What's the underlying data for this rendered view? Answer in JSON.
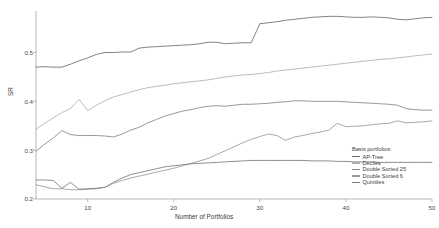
{
  "chart_data": {
    "type": "line",
    "title": "",
    "xlabel": "Number of Portfolios",
    "ylabel": "SR",
    "xlim": [
      4,
      50
    ],
    "ylim": [
      0.2,
      0.585
    ],
    "grid": false,
    "legend_position": "right-inside-bottom",
    "legend_title": "Basis portfolios:",
    "xticks": [
      10,
      20,
      30,
      40,
      50
    ],
    "xtick_labels": [
      "10",
      "20",
      "30",
      "40",
      "50"
    ],
    "yticks": [
      0.2,
      0.3,
      0.4,
      0.5
    ],
    "ytick_labels": [
      "0.2",
      "0.3",
      "0.4",
      "0.5"
    ],
    "x": [
      4,
      5,
      6,
      7,
      8,
      9,
      10,
      11,
      12,
      13,
      14,
      15,
      16,
      17,
      18,
      19,
      20,
      21,
      22,
      23,
      24,
      25,
      26,
      27,
      28,
      29,
      30,
      31,
      32,
      33,
      34,
      35,
      36,
      37,
      38,
      39,
      40,
      41,
      42,
      43,
      44,
      45,
      46,
      47,
      48,
      49,
      50
    ],
    "series": [
      {
        "name": "AP-Tree",
        "color": "#6b6b6b",
        "values": [
          0.47,
          0.471,
          0.47,
          0.47,
          0.476,
          0.483,
          0.489,
          0.496,
          0.5,
          0.5,
          0.501,
          0.501,
          0.509,
          0.511,
          0.512,
          0.513,
          0.514,
          0.515,
          0.516,
          0.518,
          0.521,
          0.521,
          0.518,
          0.519,
          0.52,
          0.52,
          0.559,
          0.561,
          0.563,
          0.566,
          0.568,
          0.57,
          0.572,
          0.573,
          0.574,
          0.574,
          0.573,
          0.572,
          0.572,
          0.573,
          0.572,
          0.571,
          0.568,
          0.567,
          0.569,
          0.571,
          0.572
        ]
      },
      {
        "name": "Deciles",
        "color": "#b0b0b0",
        "values": [
          0.343,
          0.355,
          0.366,
          0.377,
          0.385,
          0.404,
          0.381,
          0.392,
          0.401,
          0.409,
          0.414,
          0.419,
          0.424,
          0.428,
          0.431,
          0.433,
          0.436,
          0.438,
          0.44,
          0.442,
          0.444,
          0.447,
          0.45,
          0.452,
          0.454,
          0.455,
          0.457,
          0.459,
          0.462,
          0.464,
          0.466,
          0.468,
          0.47,
          0.472,
          0.474,
          0.476,
          0.478,
          0.48,
          0.482,
          0.484,
          0.486,
          0.487,
          0.489,
          0.491,
          0.493,
          0.495,
          0.497
        ]
      },
      {
        "name": "Double Sorted 25",
        "color": "#868686",
        "values": [
          0.298,
          0.312,
          0.325,
          0.34,
          0.332,
          0.33,
          0.33,
          0.33,
          0.329,
          0.327,
          0.333,
          0.341,
          0.347,
          0.356,
          0.363,
          0.37,
          0.375,
          0.38,
          0.383,
          0.387,
          0.39,
          0.391,
          0.39,
          0.392,
          0.394,
          0.394,
          0.395,
          0.396,
          0.398,
          0.399,
          0.401,
          0.401,
          0.4,
          0.4,
          0.4,
          0.4,
          0.399,
          0.398,
          0.397,
          0.396,
          0.395,
          0.394,
          0.392,
          0.385,
          0.383,
          0.382,
          0.382
        ]
      },
      {
        "name": "Double Sorted 6",
        "color": "#9a9a9a",
        "values": [
          0.229,
          0.225,
          0.221,
          0.221,
          0.219,
          0.219,
          0.22,
          0.221,
          0.224,
          0.232,
          0.238,
          0.243,
          0.247,
          0.251,
          0.255,
          0.259,
          0.263,
          0.268,
          0.273,
          0.278,
          0.283,
          0.291,
          0.299,
          0.307,
          0.315,
          0.322,
          0.328,
          0.333,
          0.33,
          0.32,
          0.327,
          0.33,
          0.334,
          0.337,
          0.341,
          0.355,
          0.348,
          0.349,
          0.35,
          0.352,
          0.354,
          0.355,
          0.36,
          0.356,
          0.357,
          0.358,
          0.36
        ]
      },
      {
        "name": "Quintiles",
        "color": "#7a7a7a",
        "values": [
          0.239,
          0.239,
          0.238,
          0.222,
          0.234,
          0.22,
          0.221,
          0.222,
          0.224,
          0.234,
          0.243,
          0.25,
          0.254,
          0.258,
          0.262,
          0.266,
          0.268,
          0.27,
          0.272,
          0.273,
          0.274,
          0.275,
          0.276,
          0.277,
          0.278,
          0.279,
          0.279,
          0.279,
          0.279,
          0.279,
          0.279,
          0.279,
          0.278,
          0.278,
          0.278,
          0.277,
          0.277,
          0.276,
          0.276,
          0.276,
          0.275,
          0.275,
          0.275,
          0.275,
          0.275,
          0.275,
          0.275
        ]
      }
    ]
  },
  "axes": {
    "ylabel": "SR",
    "xlabel": "Number of Portfolios",
    "ytick_0": "0.2",
    "ytick_1": "0.3",
    "ytick_2": "0.4",
    "ytick_3": "0.5",
    "xtick_0": "10",
    "xtick_1": "20",
    "xtick_2": "30",
    "xtick_3": "40",
    "xtick_4": "50"
  },
  "legend": {
    "title": "Basis portfolios:",
    "items": [
      {
        "label": "AP-Tree",
        "color": "#6b6b6b"
      },
      {
        "label": "Deciles",
        "color": "#b0b0b0"
      },
      {
        "label": "Double Sorted 25",
        "color": "#868686"
      },
      {
        "label": "Double Sorted 6",
        "color": "#9a9a9a"
      },
      {
        "label": "Quintiles",
        "color": "#7a7a7a"
      }
    ]
  },
  "style": {
    "axis_color": "#9a9a9a",
    "text_color": "#3c3c3c",
    "background": "#ffffff"
  }
}
